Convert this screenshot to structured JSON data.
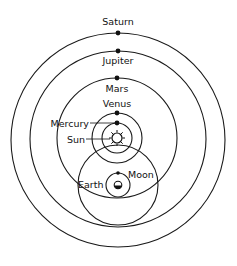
{
  "diagram": {
    "type": "geo-heliocentric (Tychonic) system",
    "labels": {
      "saturn": "Saturn",
      "jupiter": "Jupiter",
      "mars": "Mars",
      "venus": "Venus",
      "mercury": "Mercury",
      "sun": "Sun",
      "earth": "Earth",
      "moon": "Moon"
    },
    "bodies": [
      {
        "name": "Saturn",
        "orbits": "Sun"
      },
      {
        "name": "Jupiter",
        "orbits": "Sun"
      },
      {
        "name": "Mars",
        "orbits": "Sun"
      },
      {
        "name": "Venus",
        "orbits": "Sun"
      },
      {
        "name": "Mercury",
        "orbits": "Sun"
      },
      {
        "name": "Sun",
        "orbits": "Earth"
      },
      {
        "name": "Moon",
        "orbits": "Earth"
      },
      {
        "name": "Earth",
        "orbits": null
      }
    ],
    "colors": {
      "line": "#1a1a1a",
      "background": "#ffffff"
    }
  }
}
